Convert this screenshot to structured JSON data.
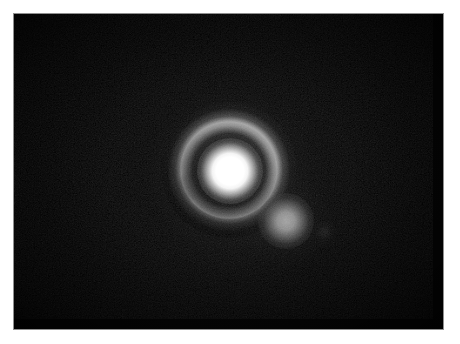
{
  "image": {
    "kind": "astronomical-photograph",
    "caption": "Monochrome astronomical exposure of a bright saturated point source surrounded by a circular halo ring, with a fainter companion source to the lower right.",
    "media": "grayscale photographic plate print with white paper margin",
    "background_color": "#050505",
    "paper_color": "#ffffff",
    "plate_edge_color": "#8f8f8f",
    "plate": {
      "left": 14,
      "top": 14,
      "width": 429,
      "height": 315
    },
    "objects": [
      {
        "name": "primary-source",
        "label": "bright saturated core",
        "center_x": 230,
        "center_y": 171,
        "radius": 20,
        "peak_color": "#ffffff",
        "relative_brightness": 1.0
      },
      {
        "name": "primary-halo-ring",
        "label": "circular halo / diffraction ring",
        "center_x": 229,
        "center_y": 170,
        "inner_radius": 22,
        "peak_radius": 32,
        "outer_radius": 42,
        "peak_color": "#bababa",
        "relative_brightness": 0.44,
        "brightest_sector": "upper-right",
        "faintest_sector": "lower-left"
      },
      {
        "name": "companion-source",
        "label": "faint companion blob",
        "center_x": 286,
        "center_y": 221,
        "radius": 14,
        "peak_color": "#a4a4a4",
        "relative_brightness": 0.38
      }
    ]
  }
}
